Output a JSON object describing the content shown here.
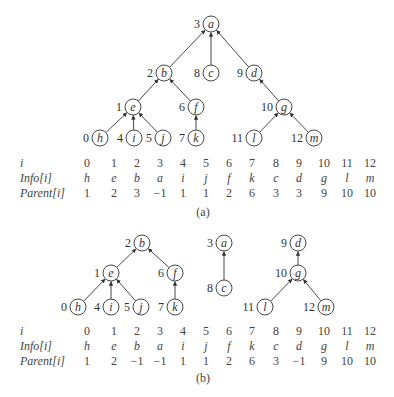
{
  "figure_a": {
    "caption": "(a)",
    "nodes": [
      {
        "id": "a",
        "index": "3",
        "x": 211,
        "y": 24
      },
      {
        "id": "b",
        "index": "2",
        "x": 164,
        "y": 73
      },
      {
        "id": "c",
        "index": "8",
        "x": 211,
        "y": 73
      },
      {
        "id": "d",
        "index": "9",
        "x": 254,
        "y": 73
      },
      {
        "id": "e",
        "index": "1",
        "x": 133,
        "y": 107
      },
      {
        "id": "f",
        "index": "6",
        "x": 196,
        "y": 107
      },
      {
        "id": "g",
        "index": "10",
        "x": 284,
        "y": 107
      },
      {
        "id": "h",
        "index": "0",
        "x": 100,
        "y": 138
      },
      {
        "id": "i",
        "index": "4",
        "x": 134,
        "y": 138
      },
      {
        "id": "j",
        "index": "5",
        "x": 163,
        "y": 138
      },
      {
        "id": "k",
        "index": "7",
        "x": 196,
        "y": 138
      },
      {
        "id": "l",
        "index": "11",
        "x": 254,
        "y": 138
      },
      {
        "id": "m",
        "index": "12",
        "x": 314,
        "y": 138
      }
    ],
    "edges": [
      [
        "b",
        "a"
      ],
      [
        "c",
        "a"
      ],
      [
        "d",
        "a"
      ],
      [
        "e",
        "b"
      ],
      [
        "f",
        "b"
      ],
      [
        "g",
        "d"
      ],
      [
        "h",
        "e"
      ],
      [
        "i",
        "e"
      ],
      [
        "j",
        "e"
      ],
      [
        "k",
        "f"
      ],
      [
        "l",
        "g"
      ],
      [
        "m",
        "g"
      ]
    ],
    "table": {
      "row_labels": {
        "i": "i",
        "info": "Info[i]",
        "parent": "Parent[i]"
      },
      "i": [
        "0",
        "1",
        "2",
        "3",
        "4",
        "5",
        "6",
        "7",
        "8",
        "9",
        "10",
        "11",
        "12"
      ],
      "info": [
        "h",
        "e",
        "b",
        "a",
        "i",
        "j",
        "f",
        "k",
        "c",
        "d",
        "g",
        "l",
        "m"
      ],
      "parent": [
        "1",
        "2",
        "3",
        "−1",
        "1",
        "1",
        "2",
        "6",
        "3",
        "3",
        "9",
        "10",
        "10"
      ]
    }
  },
  "figure_b": {
    "caption": "(b)",
    "nodes": [
      {
        "id": "b",
        "index": "2",
        "x": 142,
        "y": 243
      },
      {
        "id": "a",
        "index": "3",
        "x": 224,
        "y": 243
      },
      {
        "id": "d",
        "index": "9",
        "x": 298,
        "y": 243
      },
      {
        "id": "e",
        "index": "1",
        "x": 111,
        "y": 273
      },
      {
        "id": "f",
        "index": "6",
        "x": 175,
        "y": 273
      },
      {
        "id": "g",
        "index": "10",
        "x": 298,
        "y": 273
      },
      {
        "id": "c",
        "index": "8",
        "x": 224,
        "y": 288
      },
      {
        "id": "h",
        "index": "0",
        "x": 78,
        "y": 307
      },
      {
        "id": "i",
        "index": "4",
        "x": 111,
        "y": 307
      },
      {
        "id": "j",
        "index": "5",
        "x": 141,
        "y": 307
      },
      {
        "id": "k",
        "index": "7",
        "x": 175,
        "y": 307
      },
      {
        "id": "l",
        "index": "11",
        "x": 265,
        "y": 307
      },
      {
        "id": "m",
        "index": "12",
        "x": 326,
        "y": 307
      }
    ],
    "edges": [
      [
        "e",
        "b"
      ],
      [
        "f",
        "b"
      ],
      [
        "c",
        "a"
      ],
      [
        "g",
        "d"
      ],
      [
        "h",
        "e"
      ],
      [
        "i",
        "e"
      ],
      [
        "j",
        "e"
      ],
      [
        "k",
        "f"
      ],
      [
        "l",
        "g"
      ],
      [
        "m",
        "g"
      ]
    ],
    "table": {
      "row_labels": {
        "i": "i",
        "info": "Info[i]",
        "parent": "Parent[i]"
      },
      "i": [
        "0",
        "1",
        "2",
        "3",
        "4",
        "5",
        "6",
        "7",
        "8",
        "9",
        "10",
        "11",
        "12"
      ],
      "info": [
        "h",
        "e",
        "b",
        "a",
        "i",
        "j",
        "f",
        "k",
        "c",
        "d",
        "g",
        "l",
        "m"
      ],
      "parent": [
        "1",
        "2",
        "−1",
        "−1",
        "1",
        "1",
        "2",
        "6",
        "3",
        "−1",
        "9",
        "10",
        "10"
      ]
    }
  },
  "layout": {
    "col_x": [
      87,
      114,
      137,
      160,
      183,
      206,
      229,
      252,
      276,
      299,
      324,
      347,
      370
    ],
    "a_rows_y": [
      156,
      171,
      186
    ],
    "b_rows_y": [
      324,
      339,
      354
    ],
    "a_caption_y": 205,
    "b_caption_y": 371
  }
}
